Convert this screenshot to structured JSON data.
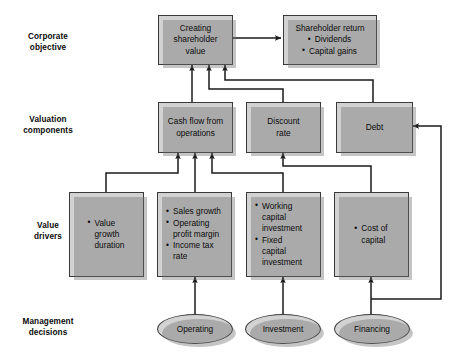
{
  "diagram": {
    "colors": {
      "node_fill": "#d2d2d2",
      "node_border": "#3a3a3a",
      "connector": "#1a1a1a",
      "shadow": "rgba(110,110,110,0.40)",
      "background": "#ffffff"
    },
    "row_labels": [
      {
        "id": "corporate-objective",
        "line1": "Corporate",
        "line2": "objective"
      },
      {
        "id": "valuation-components",
        "line1": "Valuation",
        "line2": "components"
      },
      {
        "id": "value-drivers",
        "line1": "Value",
        "line2": "drivers"
      },
      {
        "id": "management-decisions",
        "line1": "Management",
        "line2": "decisions"
      }
    ],
    "nodes": {
      "creating_shareholder_value": {
        "line1": "Creating",
        "line2": "shareholder",
        "line3": "value"
      },
      "shareholder_return": {
        "heading": "Shareholder return",
        "bullets": [
          "Dividends",
          "Capital gains"
        ]
      },
      "cash_flow_from_operations": {
        "line1": "Cash flow from",
        "line2": "operations"
      },
      "discount_rate": {
        "line1": "Discount",
        "line2": "rate"
      },
      "debt": {
        "label": "Debt"
      },
      "value_growth_duration": {
        "bullets": [
          "Value\ngrowth\nduration"
        ],
        "b1l1": "Value",
        "b1l2": "growth",
        "b1l3": "duration"
      },
      "operating_drivers": {
        "b1l1": "Sales growth",
        "b2l1": "Operating",
        "b2l2": "profit margin",
        "b3l1": "Income tax",
        "b3l2": "rate"
      },
      "investment_drivers": {
        "b1l1": "Working",
        "b1l2": "capital",
        "b1l3": "investment",
        "b2l1": "Fixed",
        "b2l2": "capital",
        "b2l3": "investment"
      },
      "cost_of_capital": {
        "b1l1": "Cost of",
        "b1l2": "capital"
      }
    },
    "decisions": [
      {
        "id": "operating",
        "label": "Operating"
      },
      {
        "id": "investment",
        "label": "Investment"
      },
      {
        "id": "financing",
        "label": "Financing"
      }
    ]
  }
}
